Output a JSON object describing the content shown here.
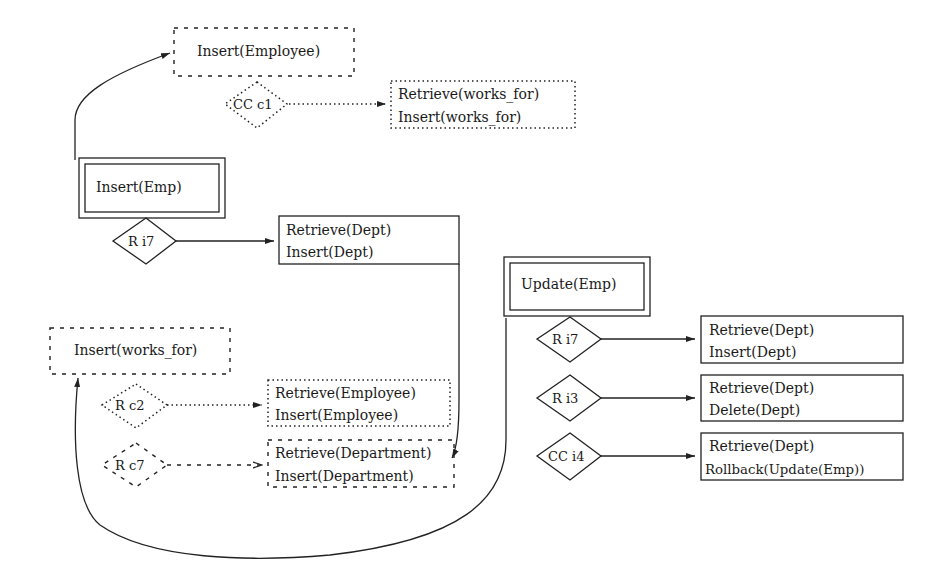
{
  "diagram": {
    "insert_emp": {
      "title": "Insert(Emp)",
      "target_insert_employee": "Insert(Employee)",
      "cc_c1": {
        "label": "CC c1",
        "actions": [
          "Retrieve(works_for)",
          "Insert(works_for)"
        ]
      },
      "r_i7": {
        "label": "R i7",
        "actions": [
          "Retrieve(Dept)",
          "Insert(Dept)"
        ]
      }
    },
    "insert_works_for": {
      "title": "Insert(works_for)",
      "r_c2": {
        "label": "R c2",
        "actions": [
          "Retrieve(Employee)",
          "Insert(Employee)"
        ]
      },
      "r_c7": {
        "label": "R c7",
        "actions": [
          "Retrieve(Department)",
          "Insert(Department)"
        ]
      }
    },
    "update_emp": {
      "title": "Update(Emp)",
      "r_i7": {
        "label": "R i7",
        "actions": [
          "Retrieve(Dept)",
          "Insert(Dept)"
        ]
      },
      "r_i3": {
        "label": "R i3",
        "actions": [
          "Retrieve(Dept)",
          "Delete(Dept)"
        ]
      },
      "cc_i4": {
        "label": "CC i4",
        "actions": [
          "Retrieve(Dept)",
          "Rollback(Update(Emp))"
        ]
      }
    },
    "legend": {
      "box_solid": "double-border box = triggering operation",
      "box_dotted": "dotted = conditional rule",
      "box_dashed": "dashed = derived operation"
    }
  }
}
